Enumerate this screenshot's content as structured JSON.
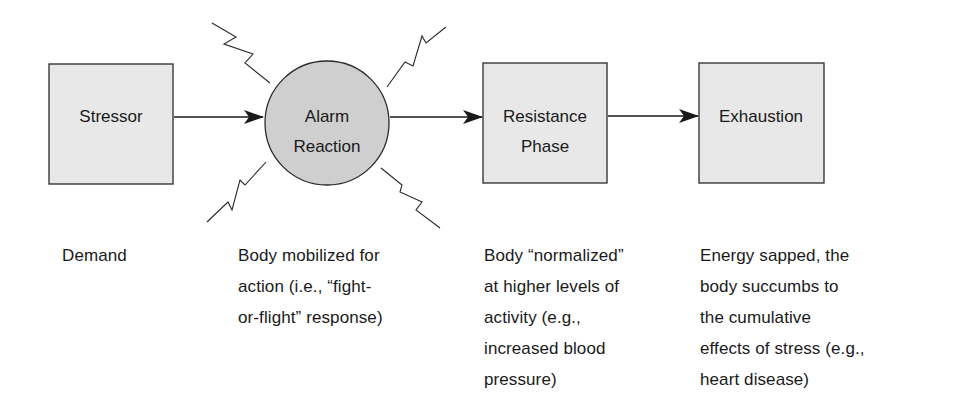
{
  "diagram": {
    "colors": {
      "box_fill": "#e8e8e8",
      "circle_fill": "#cfcfcf",
      "stroke": "#2a2a2a"
    },
    "nodes": [
      {
        "id": "stressor",
        "shape": "rect",
        "lines": [
          "Stressor"
        ]
      },
      {
        "id": "alarm",
        "shape": "circle",
        "lines": [
          "Alarm",
          "Reaction"
        ]
      },
      {
        "id": "resistance",
        "shape": "rect",
        "lines": [
          "Resistance",
          "Phase"
        ]
      },
      {
        "id": "exhaustion",
        "shape": "rect",
        "lines": [
          "Exhaustion"
        ]
      }
    ],
    "edges": [
      {
        "from": "stressor",
        "to": "alarm"
      },
      {
        "from": "alarm",
        "to": "resistance"
      },
      {
        "from": "resistance",
        "to": "exhaustion"
      }
    ],
    "descriptions": [
      {
        "node": "stressor",
        "text": "Demand"
      },
      {
        "node": "alarm",
        "text": "Body mobilized for\naction (i.e., “fight-\nor-flight” response)"
      },
      {
        "node": "resistance",
        "text": "Body “normalized”\nat higher levels of\nactivity (e.g.,\nincreased blood\npressure)"
      },
      {
        "node": "exhaustion",
        "text": "Energy sapped, the\nbody succumbs to\nthe cumulative\neffects of stress (e.g.,\nheart disease)"
      }
    ]
  }
}
